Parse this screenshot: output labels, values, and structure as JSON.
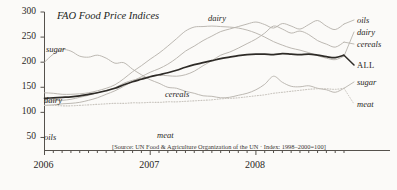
{
  "chart_data": {
    "type": "line",
    "title": "FAO Food Price Indices",
    "subtitle": "",
    "xlabel": "",
    "ylabel": "",
    "source_note": "[Source: UN Food & Agriculture Organization of the UN · Index: 1998–2000=100]",
    "ylim": [
      25,
      300
    ],
    "yticks": [
      50,
      100,
      150,
      200,
      250,
      300
    ],
    "ytick_labels": [
      "50",
      "100",
      "150",
      "200",
      "250",
      "300"
    ],
    "xlim": [
      "2006-01",
      "2008-11"
    ],
    "xticks": [
      "2006",
      "2007",
      "2008"
    ],
    "xtick_labels": [
      "2006",
      "2007",
      "2008"
    ],
    "x_minor_ticks": "monthly",
    "grid": false,
    "legend_position": "inline-right",
    "x": [
      "2006-01",
      "2006-02",
      "2006-03",
      "2006-04",
      "2006-05",
      "2006-06",
      "2006-07",
      "2006-08",
      "2006-09",
      "2006-10",
      "2006-11",
      "2006-12",
      "2007-01",
      "2007-02",
      "2007-03",
      "2007-04",
      "2007-05",
      "2007-06",
      "2007-07",
      "2007-08",
      "2007-09",
      "2007-10",
      "2007-11",
      "2007-12",
      "2008-01",
      "2008-02",
      "2008-03",
      "2008-04",
      "2008-05",
      "2008-06",
      "2008-07",
      "2008-08",
      "2008-09",
      "2008-10",
      "2008-11"
    ],
    "series": [
      {
        "name": "sugar",
        "style": "light",
        "values": [
          200,
          216,
          225,
          222,
          212,
          210,
          214,
          208,
          198,
          199,
          186,
          175,
          165,
          158,
          150,
          148,
          142,
          138,
          133,
          132,
          129,
          130,
          134,
          138,
          145,
          156,
          172,
          160,
          152,
          151,
          153,
          148,
          145,
          140,
          148
        ]
      },
      {
        "name": "dairy",
        "style": "light",
        "values": [
          139,
          138,
          136,
          136,
          137,
          139,
          143,
          148,
          155,
          167,
          181,
          193,
          206,
          218,
          232,
          247,
          262,
          270,
          271,
          272,
          271,
          270,
          268,
          264,
          258,
          250,
          241,
          234,
          228,
          224,
          219,
          213,
          208,
          205,
          212
        ]
      },
      {
        "name": "cereals",
        "style": "light",
        "values": [
          122,
          123,
          124,
          126,
          130,
          134,
          139,
          144,
          149,
          158,
          164,
          168,
          172,
          174,
          173,
          172,
          175,
          182,
          193,
          203,
          214,
          220,
          228,
          237,
          246,
          258,
          272,
          266,
          258,
          262,
          255,
          243,
          236,
          230,
          240
        ]
      },
      {
        "name": "oils",
        "style": "light",
        "values": [
          114,
          115,
          117,
          118,
          120,
          124,
          129,
          136,
          143,
          152,
          162,
          171,
          180,
          187,
          196,
          208,
          222,
          232,
          243,
          252,
          261,
          266,
          271,
          276,
          280,
          275,
          268,
          277,
          272,
          266,
          275,
          283,
          272,
          265,
          276
        ]
      },
      {
        "name": "ALL",
        "style": "bold",
        "values": [
          128,
          129,
          130,
          131,
          133,
          136,
          139,
          143,
          148,
          155,
          161,
          166,
          171,
          175,
          179,
          184,
          190,
          195,
          199,
          203,
          207,
          210,
          213,
          215,
          216,
          216,
          215,
          217,
          216,
          215,
          216,
          214,
          211,
          209,
          214
        ]
      },
      {
        "name": "meat",
        "style": "dotted",
        "values": [
          114,
          114,
          113,
          113,
          114,
          115,
          116,
          117,
          118,
          118,
          119,
          119,
          120,
          120,
          121,
          121,
          122,
          123,
          124,
          125,
          127,
          128,
          129,
          131,
          133,
          135,
          138,
          140,
          142,
          144,
          146,
          147,
          147,
          146,
          148
        ]
      }
    ],
    "inline_labels": [
      {
        "name": "sugar",
        "text": "sugar",
        "x": 46,
        "y": 45
      },
      {
        "name": "dairy-left",
        "text": "dairy",
        "x": 44,
        "y": 96
      },
      {
        "name": "oils-left",
        "text": "oils",
        "x": 44,
        "y": 133
      },
      {
        "name": "cereals",
        "text": "cereals",
        "x": 165,
        "y": 90
      },
      {
        "name": "meat-mid",
        "text": "meat",
        "x": 157,
        "y": 131
      },
      {
        "name": "dairy-top",
        "text": "dairy",
        "x": 208,
        "y": 14
      }
    ],
    "right_labels": [
      {
        "name": "oils",
        "text": "oils",
        "x": 357,
        "y": 20,
        "style": "italic"
      },
      {
        "name": "dairy",
        "text": "dairy",
        "x": 357,
        "y": 32,
        "style": "italic"
      },
      {
        "name": "cereals",
        "text": "cereals",
        "x": 357,
        "y": 44,
        "style": "italic"
      },
      {
        "name": "ALL",
        "text": "ALL",
        "x": 357,
        "y": 65,
        "style": "roman"
      },
      {
        "name": "sugar",
        "text": "sugar",
        "x": 357,
        "y": 82,
        "style": "italic"
      },
      {
        "name": "meat",
        "text": "meat",
        "x": 357,
        "y": 104,
        "style": "italic"
      }
    ]
  },
  "colors": {
    "background": "#fbfaf8",
    "axis": "#55514c",
    "text": "#2a2724",
    "line_light": "#b8b4ae",
    "line_bold": "#2e2b27",
    "line_dotted": "#c9c5bf"
  }
}
